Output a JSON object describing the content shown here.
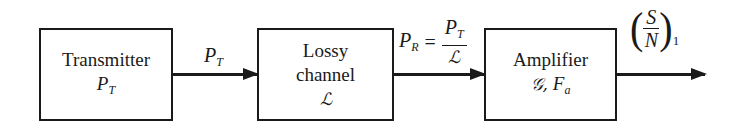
{
  "diagram": {
    "type": "block-diagram",
    "blocks": [
      {
        "id": "transmitter",
        "label": "Transmitter",
        "symbol_base": "P",
        "symbol_sub": "T"
      },
      {
        "id": "lossy-channel",
        "label_line1": "Lossy",
        "label_line2": "channel",
        "symbol": "ℒ"
      },
      {
        "id": "amplifier",
        "label": "Amplifier",
        "symbol_gain": "𝒢,",
        "symbol_nf_base": "F",
        "symbol_nf_sub": "a"
      }
    ],
    "edges": [
      {
        "from": "transmitter",
        "to": "lossy-channel",
        "label_base": "P",
        "label_sub": "T"
      },
      {
        "from": "lossy-channel",
        "to": "amplifier",
        "lhs_base": "P",
        "lhs_sub": "R",
        "equals": "=",
        "num_base": "P",
        "num_sub": "T",
        "den": "ℒ"
      },
      {
        "from": "amplifier",
        "to": "output",
        "open_paren": "(",
        "num": "S",
        "den": "N",
        "close_paren": ")",
        "sub": "1"
      }
    ]
  }
}
